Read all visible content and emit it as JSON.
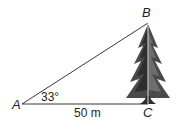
{
  "diagram": {
    "type": "right-triangle-with-tree",
    "vertices": {
      "A": {
        "label": "A"
      },
      "B": {
        "label": "B"
      },
      "C": {
        "label": "C"
      }
    },
    "angle_label": "33°",
    "base_label": "50 m",
    "colors": {
      "line": "#231f20",
      "tree_dark": "#3a3a3a",
      "tree_mid": "#6a6a6a",
      "background": "#ffffff"
    }
  }
}
